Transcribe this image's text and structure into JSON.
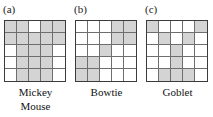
{
  "figure": {
    "type": "polyomino-pattern-diagram",
    "grid_rows": 5,
    "grid_cols": 5,
    "shaded_color": "#d4d4d4",
    "empty_color": "#ffffff",
    "grid_line_color": "#6e6e6e",
    "border_color": "#3b3b3b"
  },
  "panels": [
    {
      "letter": "(a)",
      "name": "Mickey Mouse",
      "caption_line1": "Mickey",
      "caption_line2": "Mouse",
      "cells": [
        [
          1,
          1,
          0,
          1,
          1
        ],
        [
          1,
          1,
          1,
          1,
          1
        ],
        [
          0,
          1,
          1,
          1,
          0
        ],
        [
          0,
          1,
          1,
          1,
          0
        ],
        [
          0,
          1,
          1,
          1,
          0
        ]
      ]
    },
    {
      "letter": "(b)",
      "name": "Bowtie",
      "caption_line1": "Bowtie",
      "caption_line2": "",
      "cells": [
        [
          0,
          0,
          0,
          1,
          1
        ],
        [
          0,
          0,
          0,
          1,
          1
        ],
        [
          0,
          0,
          1,
          0,
          0
        ],
        [
          1,
          1,
          0,
          0,
          0
        ],
        [
          1,
          1,
          0,
          0,
          0
        ]
      ]
    },
    {
      "letter": "(c)",
      "name": "Goblet",
      "caption_line1": "Goblet",
      "caption_line2": "",
      "cells": [
        [
          1,
          0,
          0,
          0,
          1
        ],
        [
          0,
          1,
          0,
          1,
          0
        ],
        [
          0,
          0,
          1,
          0,
          0
        ],
        [
          0,
          0,
          1,
          0,
          0
        ],
        [
          0,
          1,
          1,
          1,
          0
        ]
      ]
    }
  ]
}
